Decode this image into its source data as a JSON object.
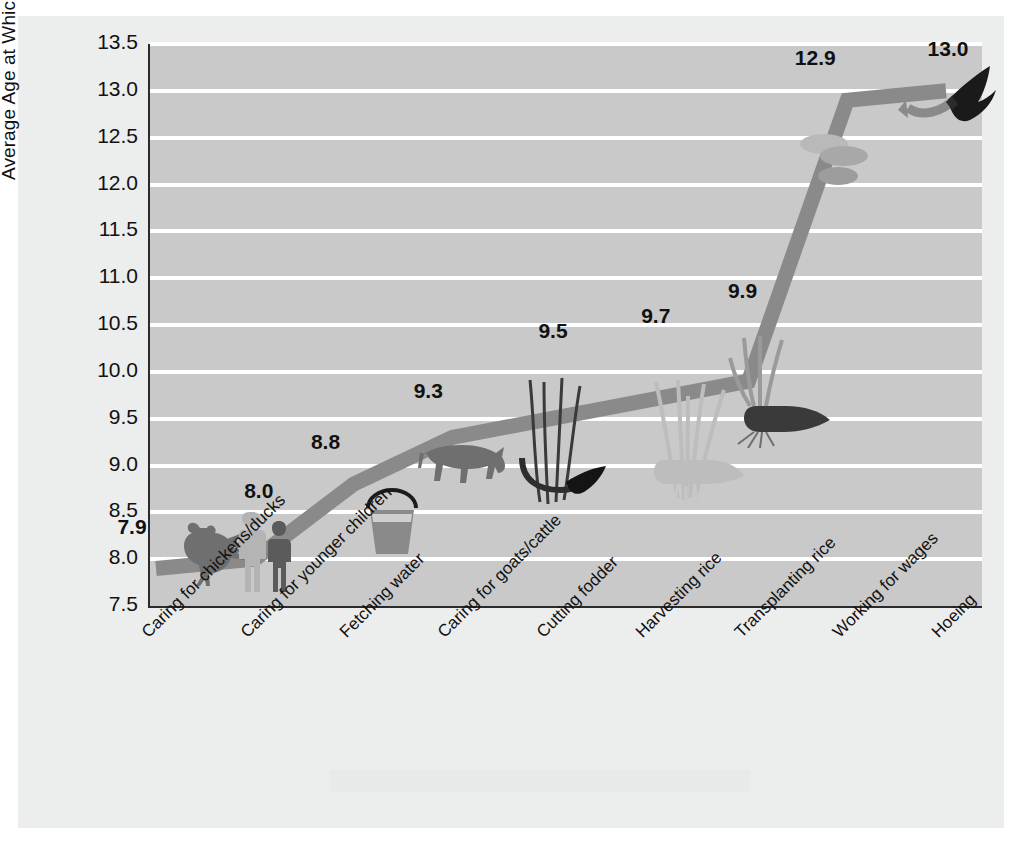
{
  "chart_data": {
    "type": "line",
    "title": "",
    "xlabel": "",
    "ylabel": "Average Age at Which Activity Begins",
    "ylim": [
      7.5,
      13.5
    ],
    "ytick_step": 0.5,
    "yticks": [
      "13.5",
      "13.0",
      "12.5",
      "12.0",
      "11.5",
      "11.0",
      "10.5",
      "10.0",
      "9.5",
      "9.0",
      "8.5",
      "8.0",
      "7.5"
    ],
    "grid": true,
    "legend": "none",
    "categories": [
      "Caring for chickens/ducks",
      "Caring for younger children",
      "Fetching water",
      "Caring for goats/cattle",
      "Cutting fodder",
      "Harvesting  rice",
      "Transplanting rice",
      "Working for wages",
      "Hoeing"
    ],
    "values": [
      7.9,
      8.0,
      8.8,
      9.3,
      9.5,
      9.7,
      9.9,
      12.9,
      13.0
    ],
    "value_labels": [
      "7.9",
      "8.0",
      "8.8",
      "9.3",
      "9.5",
      "9.7",
      "9.9",
      "12.9",
      "13.0"
    ],
    "point_icons": [
      "rooster-icon",
      "children-icon",
      "water-bucket-icon",
      "cattle-icon",
      "fodder-sickle-icon",
      "rice-sheaf-icon",
      "rice-seedling-icon",
      "coins-icon",
      "hoe-icon"
    ]
  },
  "style": {
    "panel_color": "#eceded",
    "plot_background": "#c9c9c9",
    "gridline_color": "#ffffff",
    "ribbon_color": "#8a8a8a",
    "axis_color": "#2b2b2b",
    "text_color": "#111111"
  }
}
